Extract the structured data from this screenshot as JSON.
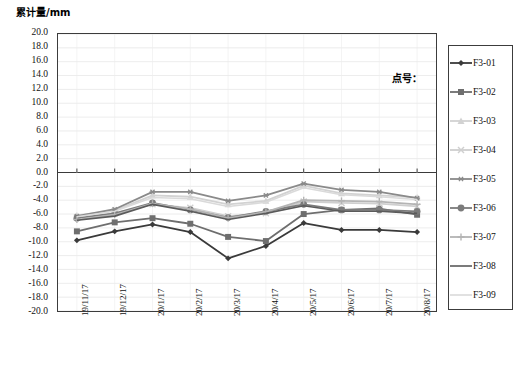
{
  "chart_data": {
    "type": "line",
    "title": "",
    "ylabel": "累计量/mm",
    "xlabel": "",
    "ylim": [
      -20.0,
      20.0
    ],
    "ytick_step": 2.0,
    "grid": true,
    "legend_position": "right",
    "annotation": "点号：",
    "yticks": [
      "20.0",
      "18.0",
      "16.0",
      "14.0",
      "12.0",
      "10.0",
      "8.0",
      "6.0",
      "4.0",
      "2.0",
      "0.0",
      "-2.0",
      "-4.0",
      "-6.0",
      "-8.0",
      "-10.0",
      "-12.0",
      "-14.0",
      "-16.0",
      "-18.0",
      "-20.0"
    ],
    "categories": [
      "19/11/17",
      "19/12/17",
      "20/1/17",
      "20/2/17",
      "20/3/17",
      "20/4/17",
      "20/5/17",
      "20/6/17",
      "20/7/17",
      "20/8/17"
    ],
    "series": [
      {
        "name": "F3-01",
        "color": "#3a3a3a",
        "marker": "diamond",
        "values": [
          -9.8,
          -8.5,
          -7.5,
          -8.6,
          -12.4,
          -10.6,
          -7.3,
          -8.3,
          -8.3,
          -8.6
        ]
      },
      {
        "name": "F3-02",
        "color": "#6e6e6e",
        "marker": "square",
        "values": [
          -8.5,
          -7.2,
          -6.6,
          -7.4,
          -9.3,
          -9.9,
          -6.0,
          -5.4,
          -5.2,
          -6.1
        ]
      },
      {
        "name": "F3-03",
        "color": "#d2d2d2",
        "marker": "triangle",
        "values": [
          -6.2,
          -5.5,
          -3.3,
          -3.5,
          -4.6,
          -4.1,
          -1.9,
          -3.0,
          -3.3,
          -3.6
        ]
      },
      {
        "name": "F3-04",
        "color": "#cfcfcf",
        "marker": "x",
        "values": [
          -6.5,
          -5.9,
          -4.6,
          -5.1,
          -6.3,
          -5.9,
          -4.2,
          -4.4,
          -4.5,
          -4.9
        ]
      },
      {
        "name": "F3-05",
        "color": "#8a8a8a",
        "marker": "asterisk",
        "values": [
          -6.3,
          -5.3,
          -2.8,
          -2.8,
          -4.1,
          -3.3,
          -1.6,
          -2.5,
          -2.8,
          -3.7
        ]
      },
      {
        "name": "F3-06",
        "color": "#7b7b7b",
        "marker": "circle",
        "values": [
          -6.6,
          -5.9,
          -4.4,
          -5.4,
          -6.5,
          -5.6,
          -4.6,
          -5.4,
          -5.4,
          -5.6
        ]
      },
      {
        "name": "F3-07",
        "color": "#b4b4b4",
        "marker": "plus",
        "values": [
          -6.8,
          -6.1,
          -4.5,
          -5.3,
          -6.6,
          -5.7,
          -4.0,
          -4.1,
          -4.2,
          -4.6
        ]
      },
      {
        "name": "F3-08",
        "color": "#5a5a5a",
        "marker": "none",
        "values": [
          -6.9,
          -6.3,
          -4.6,
          -5.6,
          -6.8,
          -5.9,
          -4.8,
          -5.6,
          -5.6,
          -5.9
        ]
      },
      {
        "name": "F3-09",
        "color": "#dadada",
        "marker": "none",
        "values": [
          -6.4,
          -5.6,
          -3.6,
          -3.8,
          -4.9,
          -4.3,
          -2.2,
          -3.2,
          -3.5,
          -3.9
        ]
      }
    ]
  },
  "legend": {
    "items": [
      {
        "label": "F3-01"
      },
      {
        "label": "F3-02"
      },
      {
        "label": "F3-03"
      },
      {
        "label": "F3-04"
      },
      {
        "label": "F3-05"
      },
      {
        "label": "F3-06"
      },
      {
        "label": "F3-07"
      },
      {
        "label": "F3-08"
      },
      {
        "label": "F3-09"
      }
    ]
  }
}
